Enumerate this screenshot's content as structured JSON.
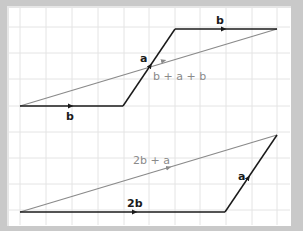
{
  "colors": {
    "frame": "#c9c9c9",
    "grid": "#e4e4e4",
    "vector": "#1a1a1a",
    "resultant": "#8a8a8a"
  },
  "grid": {
    "x_lines": [
      20,
      46,
      72,
      98,
      124,
      149,
      175,
      200,
      226,
      252,
      277
    ],
    "y_lines": [
      27,
      53,
      79,
      106,
      132,
      158,
      184,
      210
    ]
  },
  "top_figure": {
    "vectors": [
      {
        "name": "b",
        "label": "b",
        "from": [
          20,
          106
        ],
        "to": [
          123,
          106
        ]
      },
      {
        "name": "a",
        "label": "a",
        "from": [
          123,
          106
        ],
        "to": [
          175,
          29
        ]
      },
      {
        "name": "b",
        "label": "b",
        "from": [
          175,
          29
        ],
        "to": [
          277,
          29
        ]
      }
    ],
    "resultant": {
      "label": "b + a + b",
      "from": [
        20,
        106
      ],
      "to": [
        277,
        29
      ]
    }
  },
  "bottom_figure": {
    "vectors": [
      {
        "name": "2b",
        "label": "2b",
        "from": [
          20,
          212
        ],
        "to": [
          225,
          212
        ]
      },
      {
        "name": "a",
        "label": "a",
        "from": [
          225,
          212
        ],
        "to": [
          277,
          135
        ]
      }
    ],
    "resultant": {
      "label": "2b + a",
      "from": [
        20,
        212
      ],
      "to": [
        277,
        135
      ]
    }
  }
}
